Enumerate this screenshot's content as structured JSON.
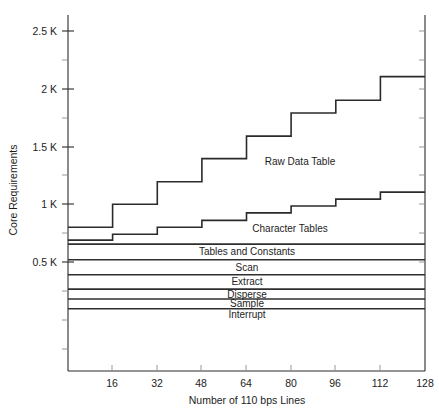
{
  "chart_data": {
    "type": "area",
    "title": "",
    "xlabel": "Number of 110 bps Lines",
    "ylabel": "Core Requirements",
    "xlim": [
      0,
      128
    ],
    "ylim": [
      0,
      2700
    ],
    "x_ticks": [
      16,
      32,
      48,
      64,
      80,
      96,
      112,
      128
    ],
    "x_tick_labels": [
      "16",
      "32",
      "48",
      "64",
      "80",
      "96",
      "112",
      "128"
    ],
    "y_ticks": [
      500,
      1000,
      1500,
      2000,
      2500
    ],
    "y_tick_labels": [
      "0.5 K",
      "1 K",
      "1.5 K",
      "2 K",
      "2.5 K"
    ],
    "grid": false,
    "legend": "inline-annotations",
    "stack_order_bottom_to_top": [
      "Interrupt",
      "Sample",
      "Disperse",
      "Extract",
      "Scan",
      "Tables and Constants",
      "Character Tables",
      "Raw Data Table"
    ],
    "constant_bands": [
      {
        "name": "Interrupt",
        "label": "Interrupt",
        "y_bottom": 0,
        "y_top": 95
      },
      {
        "name": "Sample",
        "label": "Sample",
        "y_bottom": 95,
        "y_top": 180
      },
      {
        "name": "Disperse",
        "label": "Disperse",
        "y_bottom": 180,
        "y_top": 265
      },
      {
        "name": "Extract",
        "label": "Extract",
        "y_bottom": 265,
        "y_top": 390
      },
      {
        "name": "Scan",
        "label": "Scan",
        "y_bottom": 390,
        "y_top": 520
      },
      {
        "name": "Tables and Constants",
        "label": "Tables and Constants",
        "y_bottom": 520,
        "y_top": 655
      }
    ],
    "step_series": [
      {
        "name": "Character Tables",
        "label": "Character Tables",
        "step_x_breaks": [
          0,
          16,
          32,
          48,
          64,
          80,
          96,
          112,
          128
        ],
        "cumulative_top_values": [
          690,
          740,
          800,
          860,
          925,
          985,
          1045,
          1105,
          1105
        ]
      },
      {
        "name": "Raw Data Table",
        "label": "Raw Data Table",
        "step_x_breaks": [
          0,
          16,
          32,
          48,
          64,
          80,
          96,
          112,
          128
        ],
        "cumulative_top_values": [
          800,
          1000,
          1195,
          1395,
          1590,
          1790,
          1900,
          2105,
          2105
        ]
      }
    ],
    "annotations": [
      {
        "text": "Raw Data Table",
        "x": 76,
        "y": 1500
      },
      {
        "text": "Character Tables",
        "x": 72,
        "y": 770
      }
    ]
  },
  "axes": {
    "y_title": "Core Requirements",
    "x_title": "Number of 110 bps Lines"
  },
  "colors": {
    "line": "#2b2b2b",
    "axis": "#2a2a2a",
    "text": "#1d1d1d",
    "background": "#ffffff"
  }
}
